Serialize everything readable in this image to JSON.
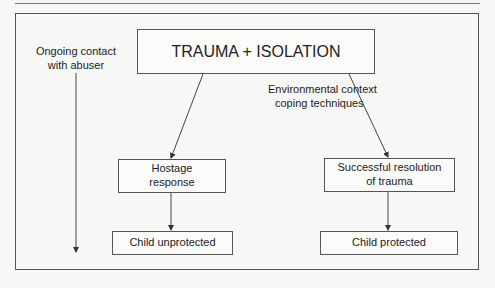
{
  "diagram": {
    "title": "TRAUMA + ISOLATION",
    "side_label": {
      "line1": "Ongoing contact",
      "line2": "with abuser"
    },
    "context_label": {
      "line1": "Environmental context",
      "line2": "coping techniques"
    },
    "left_branch": {
      "response": {
        "line1": "Hostage",
        "line2": "response"
      },
      "outcome": "Child unprotected"
    },
    "right_branch": {
      "response": {
        "line1": "Successful resolution",
        "line2": "of trauma"
      },
      "outcome": "Child protected"
    },
    "colors": {
      "line": "#444444",
      "border": "#555555",
      "background": "#f7f7f5"
    }
  }
}
